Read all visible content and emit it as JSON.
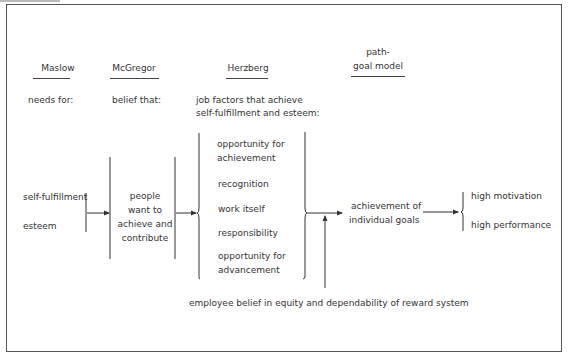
{
  "columns": {
    "maslow": {
      "header": "Maslow",
      "subheader": "needs for:",
      "items": [
        "self-fulfillment",
        "esteem"
      ]
    },
    "mcgregor": {
      "header": "McGregor",
      "subheader": "belief that:",
      "items": [
        "people",
        "want to",
        "achieve and",
        "contribute"
      ]
    },
    "herzberg": {
      "header": "Herzberg",
      "subheader_line1": "job factors that achieve",
      "subheader_line2": "self-fulfillment and esteem:",
      "items": [
        {
          "l1": "opportunity for",
          "l2": "achievement"
        },
        {
          "l1": "recognition"
        },
        {
          "l1": "work itself"
        },
        {
          "l1": "responsibility"
        },
        {
          "l1": "opportunity for",
          "l2": "advancement"
        }
      ]
    },
    "pathgoal": {
      "header_line1": "path-",
      "header_line2": "goal model",
      "items": [
        "achievement of",
        "individual goals"
      ]
    },
    "outcomes": {
      "items": [
        "high motivation",
        "high performance"
      ]
    }
  },
  "footer_note": "employee belief in equity and dependability of reward system"
}
